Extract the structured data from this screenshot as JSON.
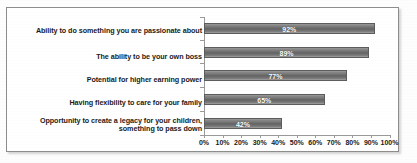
{
  "chart_data": {
    "type": "bar",
    "orientation": "horizontal",
    "title": "",
    "xlabel": "",
    "ylabel": "",
    "xlim": [
      0,
      100
    ],
    "xticks": [
      "0%",
      "10%",
      "20%",
      "30%",
      "40%",
      "50%",
      "60%",
      "70%",
      "80%",
      "90%",
      "100%"
    ],
    "grid": false,
    "legend": false,
    "categories": [
      "Ability to do something you are passionate about",
      "The ability to be your own boss",
      "Potential for higher earning power",
      "Having flexibility to care for your family",
      "Opportunity to create a legacy for your children, something to pass down"
    ],
    "values": [
      92,
      89,
      77,
      65,
      42
    ],
    "data_labels": [
      "92%",
      "89%",
      "77%",
      "65%",
      "42%"
    ],
    "bar_color": "#6f6f6f",
    "data_label_color": "#ffffff",
    "axis_color": "#9a9a9a",
    "border_color": "#8d8d8d"
  }
}
